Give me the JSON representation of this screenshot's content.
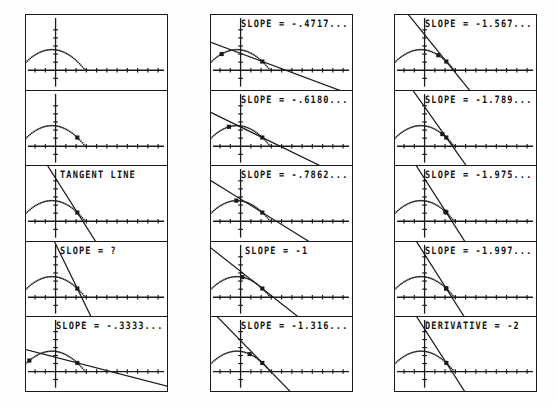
{
  "screen": {
    "title": "Tangent line limit sequence",
    "device": "graphing calculator screen sequence",
    "grid": {
      "columns": 3,
      "rows": 5,
      "panel_count": 15
    }
  },
  "axes": {
    "x_axis_name": "x-axis",
    "y_axis_name": "y-axis",
    "tick_count_right": 11,
    "tick_count_left": 4,
    "tick_count_up": 5,
    "tick_count_down": 1
  },
  "curve": {
    "name": "dotted-arc-curve",
    "style": "dotted",
    "description": "downward arc crossing the x-axis"
  },
  "panels": [
    {
      "id": "p1",
      "label": "",
      "show_label": false,
      "secant": null,
      "points": [],
      "column": 1,
      "row": 1
    },
    {
      "id": "p2",
      "label": "",
      "show_label": false,
      "secant": null,
      "points": [
        {
          "t": 0.88
        }
      ],
      "column": 1,
      "row": 2
    },
    {
      "id": "p3",
      "label": "TANGENT LINE",
      "show_label": true,
      "secant": {
        "slope": -2.0,
        "anchor": 0.88
      },
      "points": [
        {
          "t": 0.88
        }
      ],
      "column": 1,
      "row": 3
    },
    {
      "id": "p4",
      "label": "SLOPE = ?",
      "show_label": true,
      "secant": {
        "slope": -2.6,
        "anchor": 0.88
      },
      "points": [
        {
          "t": 0.88
        }
      ],
      "column": 1,
      "row": 4
    },
    {
      "id": "p5",
      "label": "SLOPE = -.3333...",
      "show_label": true,
      "secant": {
        "slope": -0.3333,
        "anchor": 0.88
      },
      "points": [
        {
          "t": 0.16
        },
        {
          "t": 0.88
        }
      ],
      "column": 1,
      "row": 5
    },
    {
      "id": "p6",
      "label": "SLOPE = -.4717...",
      "show_label": true,
      "secant": {
        "slope": -0.4717,
        "anchor": 0.88
      },
      "points": [
        {
          "t": 0.27
        },
        {
          "t": 0.88
        }
      ],
      "column": 2,
      "row": 1
    },
    {
      "id": "p7",
      "label": "SLOPE = -.6180...",
      "show_label": true,
      "secant": {
        "slope": -0.618,
        "anchor": 0.88
      },
      "points": [
        {
          "t": 0.38
        },
        {
          "t": 0.88
        }
      ],
      "column": 2,
      "row": 2
    },
    {
      "id": "p8",
      "label": "SLOPE = -.7862...",
      "show_label": true,
      "secant": {
        "slope": -0.7862,
        "anchor": 0.88
      },
      "points": [
        {
          "t": 0.49
        },
        {
          "t": 0.88
        }
      ],
      "column": 2,
      "row": 3
    },
    {
      "id": "p9",
      "label": "SLOPE = -1",
      "show_label": true,
      "secant": {
        "slope": -1.0,
        "anchor": 0.88
      },
      "points": [
        {
          "t": 0.58
        },
        {
          "t": 0.88
        }
      ],
      "column": 2,
      "row": 4
    },
    {
      "id": "p10",
      "label": "SLOPE = -1.316...",
      "show_label": true,
      "secant": {
        "slope": -1.316,
        "anchor": 0.88
      },
      "points": [
        {
          "t": 0.69
        },
        {
          "t": 0.88
        }
      ],
      "column": 2,
      "row": 5
    },
    {
      "id": "p11",
      "label": "SLOPE = -1.567...",
      "show_label": true,
      "secant": {
        "slope": -1.567,
        "anchor": 0.88
      },
      "points": [
        {
          "t": 0.76
        },
        {
          "t": 0.88
        }
      ],
      "column": 3,
      "row": 1
    },
    {
      "id": "p12",
      "label": "SLOPE = -1.789...",
      "show_label": true,
      "secant": {
        "slope": -1.789,
        "anchor": 0.88
      },
      "points": [
        {
          "t": 0.82
        },
        {
          "t": 0.88
        }
      ],
      "column": 3,
      "row": 2
    },
    {
      "id": "p13",
      "label": "SLOPE = -1.975...",
      "show_label": true,
      "secant": {
        "slope": -1.975,
        "anchor": 0.88
      },
      "points": [
        {
          "t": 0.865
        },
        {
          "t": 0.88
        }
      ],
      "column": 3,
      "row": 3
    },
    {
      "id": "p14",
      "label": "SLOPE = -1.997...",
      "show_label": true,
      "secant": {
        "slope": -1.997,
        "anchor": 0.88
      },
      "points": [
        {
          "t": 0.876
        },
        {
          "t": 0.88
        }
      ],
      "column": 3,
      "row": 4
    },
    {
      "id": "p15",
      "label": "DERIVATIVE = -2",
      "show_label": true,
      "secant": {
        "slope": -2.0,
        "anchor": 0.88
      },
      "points": [
        {
          "t": 0.88
        }
      ],
      "column": 3,
      "row": 5
    }
  ],
  "chart_data": {
    "type": "line",
    "xlabel": "",
    "ylabel": "",
    "categories": [
      "SLOPE = -.3333...",
      "SLOPE = -.4717...",
      "SLOPE = -.6180...",
      "SLOPE = -.7862...",
      "SLOPE = -1",
      "SLOPE = -1.316...",
      "SLOPE = -1.567...",
      "SLOPE = -1.789...",
      "SLOPE = -1.975...",
      "SLOPE = -1.997...",
      "DERIVATIVE = -2"
    ],
    "values": [
      -0.3333,
      -0.4717,
      -0.618,
      -0.7862,
      -1,
      -1.316,
      -1.567,
      -1.789,
      -1.975,
      -1.997,
      -2
    ],
    "annotations": [
      "TANGENT LINE",
      "SLOPE = ?"
    ],
    "grid": false,
    "legend": "none"
  },
  "colors": {
    "ink": "#1a1a1a",
    "paper": "#ffffff",
    "page": "#fefefe"
  }
}
